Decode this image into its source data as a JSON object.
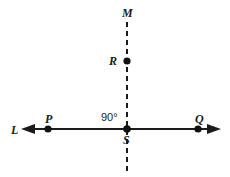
{
  "diagram": {
    "type": "geometry-perpendicular-lines",
    "background_color": "#ffffff",
    "stroke_color": "#1a1a1a",
    "labels": {
      "line_m": "M",
      "point_r": "R",
      "point_p": "P",
      "point_q": "Q",
      "line_l": "L",
      "point_s": "S",
      "angle": "90°"
    },
    "geometry": {
      "horizontal_line": {
        "name": "line-L",
        "y": 129,
        "x_start": 22,
        "x_end": 220,
        "arrow_left": true,
        "arrow_right": true,
        "style": "solid",
        "width": 2
      },
      "vertical_line": {
        "name": "line-M",
        "x": 127,
        "y_start": 22,
        "y_end": 173,
        "arrow_top": false,
        "arrow_bottom": false,
        "style": "dashed",
        "width": 2,
        "dash_on": 5,
        "dash_off": 4
      },
      "points": [
        {
          "id": "R",
          "x": 127,
          "y": 61,
          "radius": 3.6
        },
        {
          "id": "P",
          "x": 48,
          "y": 129,
          "radius": 3.6
        },
        {
          "id": "S",
          "x": 127,
          "y": 129,
          "radius": 3.8
        },
        {
          "id": "Q",
          "x": 198,
          "y": 129,
          "radius": 3.6
        }
      ]
    }
  }
}
